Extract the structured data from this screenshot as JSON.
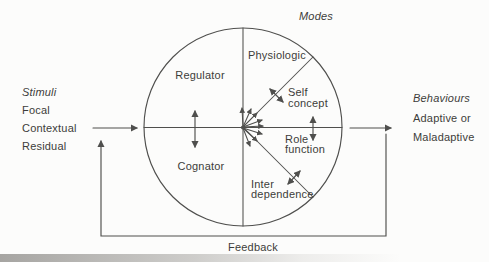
{
  "colors": {
    "background": "#fcfcfb",
    "line": "#4f4f4d",
    "text": "#3c3c3a"
  },
  "labels": {
    "modes_heading": "Modes",
    "feedback": "Feedback"
  },
  "stimuli": {
    "heading": "Stimuli",
    "items": [
      "Focal",
      "Contextual",
      "Residual"
    ]
  },
  "behaviours": {
    "heading": "Behaviours",
    "items": [
      "Adaptive or",
      "Maladaptive"
    ]
  },
  "subsystems": {
    "regulator": "Regulator",
    "cognator": "Cognator"
  },
  "modes": {
    "physiologic": "Physiologic",
    "self_concept": {
      "line1": "Self",
      "line2": "concept"
    },
    "role_function": {
      "line1": "Role",
      "line2": "function"
    },
    "interdependence": {
      "line1": "Inter",
      "line2": "dependence"
    }
  }
}
